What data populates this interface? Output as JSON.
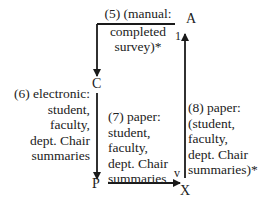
{
  "diagram": {
    "nodes": {
      "A": "A",
      "C": "C",
      "P": "P",
      "X": "X"
    },
    "markers": {
      "one": "1",
      "v": "v"
    },
    "edges": [
      {
        "id": "5",
        "from": "A",
        "to": "C",
        "lines": [
          "(5) (manual:",
          "completed",
          "survey)*"
        ]
      },
      {
        "id": "6",
        "from": "C",
        "to": "P",
        "lines": [
          "(6) electronic:",
          "student,",
          "faculty,",
          "dept. Chair",
          "summaries"
        ]
      },
      {
        "id": "7",
        "from": "P",
        "to": "X",
        "lines": [
          "(7) paper:",
          "student,",
          "faculty,",
          "dept. Chair",
          "summaries"
        ]
      },
      {
        "id": "8",
        "from": "X",
        "to": "A",
        "lines": [
          "(8) paper:",
          "(student,",
          "faculty,",
          "dept. Chair",
          "summaries)*"
        ]
      }
    ],
    "colors": {
      "line": "#1a1a1a",
      "text": "#222222",
      "background": "#ffffff"
    }
  }
}
